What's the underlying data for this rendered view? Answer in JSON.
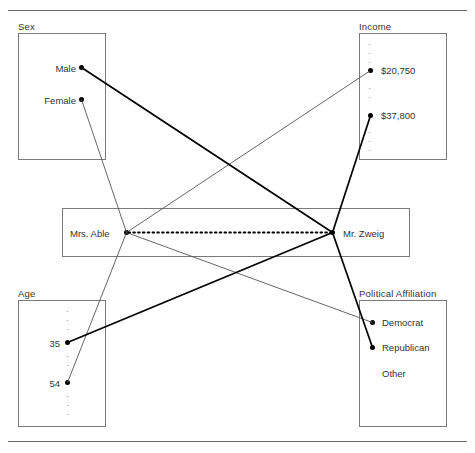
{
  "figure": {
    "width": 475,
    "height": 453,
    "line_color": "#000000",
    "box_border_color": "#7a7a7a",
    "rule_color": "#6b6b6b",
    "text_color": "#333333"
  },
  "boxes": {
    "sex": {
      "title": "Sex",
      "entries": [
        {
          "label": "Male"
        },
        {
          "label": "Female"
        }
      ]
    },
    "income": {
      "title": "Income",
      "entries": [
        {
          "label": "$20,750"
        },
        {
          "label": "$37,800"
        }
      ],
      "ellipsis_above": "···",
      "ellipsis_between": "·",
      "ellipsis_below": "···"
    },
    "age": {
      "title": "Age",
      "entries": [
        {
          "label": "35"
        },
        {
          "label": "54"
        }
      ],
      "ellipsis_above": "···",
      "ellipsis_between": "··",
      "ellipsis_below": "···"
    },
    "political_affiliation": {
      "title": "Political Affiliation",
      "entries": [
        {
          "label": "Democrat"
        },
        {
          "label": "Republican"
        },
        {
          "label": "Other"
        }
      ]
    }
  },
  "entities": {
    "left": {
      "label": "Mrs. Able"
    },
    "right": {
      "label": "Mr. Zweig"
    },
    "link_style": "dotted"
  },
  "links": [
    {
      "from": "Mrs. Able",
      "to": "Female",
      "weight": "thin"
    },
    {
      "from": "Mrs. Able",
      "to": "$20,750",
      "weight": "thin"
    },
    {
      "from": "Mrs. Able",
      "to": "54",
      "weight": "thin"
    },
    {
      "from": "Mrs. Able",
      "to": "Democrat",
      "weight": "thin"
    },
    {
      "from": "Mr. Zweig",
      "to": "Male",
      "weight": "thick"
    },
    {
      "from": "Mr. Zweig",
      "to": "$37,800",
      "weight": "thick"
    },
    {
      "from": "Mr. Zweig",
      "to": "35",
      "weight": "thick"
    },
    {
      "from": "Mr. Zweig",
      "to": "Republican",
      "weight": "thick"
    }
  ]
}
